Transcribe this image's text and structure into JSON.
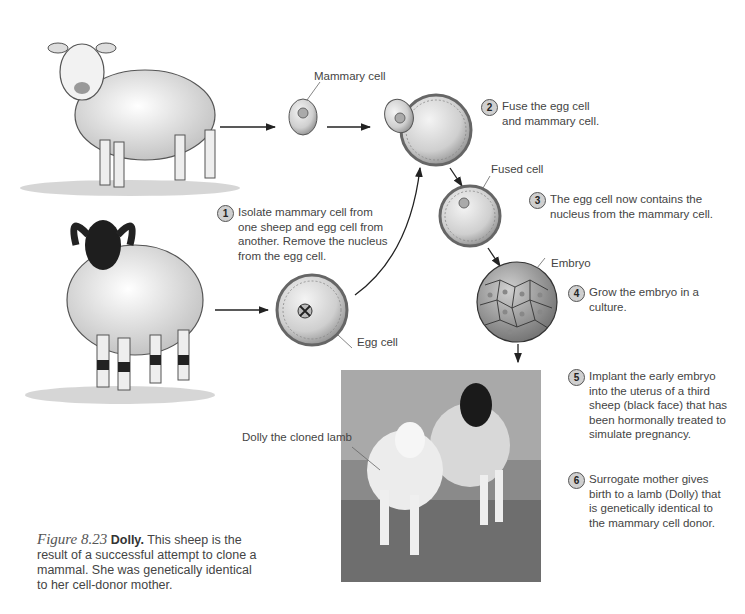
{
  "labels": {
    "mammary_cell": "Mammary cell",
    "fused_cell": "Fused cell",
    "embryo": "Embryo",
    "egg_cell": "Egg cell",
    "dolly_label": "Dolly the cloned lamb"
  },
  "steps": [
    {
      "num": "1",
      "text": "Isolate mammary cell from one sheep and egg cell from another. Remove the nucleus from the egg cell."
    },
    {
      "num": "2",
      "text": "Fuse the egg cell and mammary cell."
    },
    {
      "num": "3",
      "text": "The egg cell now contains the nucleus from the mammary cell."
    },
    {
      "num": "4",
      "text": "Grow the embryo in a culture."
    },
    {
      "num": "5",
      "text": "Implant the early embryo into the uterus of a third sheep (black face) that has been hormonally treated to simulate pregnancy."
    },
    {
      "num": "6",
      "text": "Surrogate mother gives birth to a lamb (Dolly) that is genetically identical to the mammary cell donor."
    }
  ],
  "caption": {
    "figure_number": "Figure 8.23",
    "title": "Dolly.",
    "text": "This sheep is the result of a successful attempt to clone a mammal. She was genetically identical to her cell-donor mother."
  },
  "illustrations": {
    "white_sheep": "white-faced sheep (mammary cell donor)",
    "black_sheep": "black-faced horned sheep (egg cell donor)",
    "photo": "photo of Dolly with surrogate mother"
  }
}
